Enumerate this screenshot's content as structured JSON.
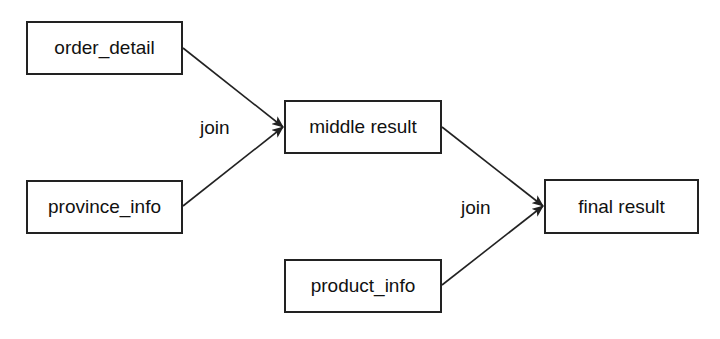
{
  "diagram": {
    "type": "flow",
    "nodes": [
      {
        "id": "order_detail",
        "label": "order_detail"
      },
      {
        "id": "province_info",
        "label": "province_info"
      },
      {
        "id": "middle_result",
        "label": "middle result"
      },
      {
        "id": "product_info",
        "label": "product_info"
      },
      {
        "id": "final_result",
        "label": "final result"
      }
    ],
    "edges": [
      {
        "from": "order_detail",
        "to": "middle_result"
      },
      {
        "from": "province_info",
        "to": "middle_result"
      },
      {
        "from": "middle_result",
        "to": "final_result"
      },
      {
        "from": "product_info",
        "to": "final_result"
      }
    ],
    "edge_labels": [
      {
        "text": "join",
        "target": "middle_result"
      },
      {
        "text": "join",
        "target": "final_result"
      }
    ],
    "colors": {
      "stroke": "#222222",
      "background": "#ffffff",
      "text": "#111111"
    }
  }
}
